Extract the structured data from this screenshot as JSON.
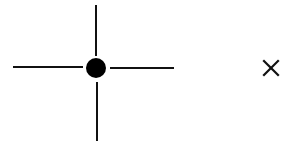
{
  "diagram": {
    "type": "crosshair-marker",
    "center": {
      "x": 96,
      "y": 68
    },
    "dot_radius": 10,
    "arms": {
      "left": {
        "x1": 13,
        "y1": 67,
        "x2": 83,
        "y2": 67
      },
      "right": {
        "x1": 110,
        "y1": 68,
        "x2": 174,
        "y2": 68
      },
      "top": {
        "x1": 96,
        "y1": 5,
        "x2": 96,
        "y2": 56
      },
      "bottom": {
        "x1": 97,
        "y1": 82,
        "x2": 97,
        "y2": 141
      }
    },
    "stroke_color": "#111111",
    "stroke_width": 2,
    "fill_color": "#000000"
  },
  "close": {
    "glyph": "×",
    "icon": "close-icon",
    "color": "#111111"
  }
}
